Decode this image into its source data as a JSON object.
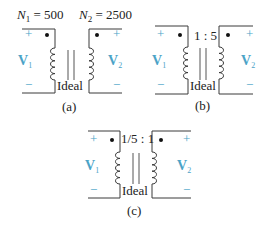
{
  "colors": {
    "wire": "#3a3a3a",
    "accent_blue": "#4ba3c7",
    "text": "#222222"
  },
  "panels": [
    {
      "id": "a",
      "caption": "(a)",
      "top_label_left": {
        "sym": "N",
        "sub": "1",
        "rest": " = 500"
      },
      "top_label_right": {
        "sym": "N",
        "sub": "2",
        "rest": " = 2500"
      },
      "core_label": "Ideal",
      "ratio_label": "",
      "plus": "+",
      "minus": "−",
      "v1": {
        "sym": "V",
        "sub": "1"
      },
      "v2": {
        "sym": "V",
        "sub": "2"
      }
    },
    {
      "id": "b",
      "caption": "(b)",
      "ratio_label": "1 : 5",
      "core_label": "Ideal",
      "plus": "+",
      "minus": "−",
      "v1": {
        "sym": "V",
        "sub": "1"
      },
      "v2": {
        "sym": "V",
        "sub": "2"
      }
    },
    {
      "id": "c",
      "caption": "(c)",
      "ratio_label": "1/5 : 1",
      "core_label": "Ideal",
      "plus": "+",
      "minus": "−",
      "v1": {
        "sym": "V",
        "sub": "1"
      },
      "v2": {
        "sym": "V",
        "sub": "2"
      }
    }
  ]
}
